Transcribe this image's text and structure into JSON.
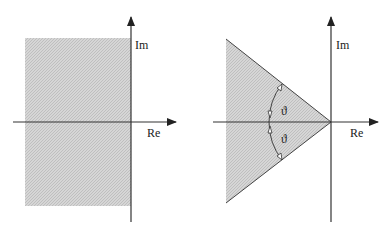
{
  "left_diagram": {
    "x_axis_label": "Re",
    "y_axis_label": "Im",
    "region": "left half-plane (Re < 0), shaded"
  },
  "right_diagram": {
    "x_axis_label": "Re",
    "y_axis_label": "Im",
    "region": "wedge sector with vertex at origin, shaded",
    "angle_label_upper": "ϑ",
    "angle_label_lower": "ϑ"
  },
  "colors": {
    "axis": "#333333",
    "shade": "#c8c8c8",
    "edge": "#444444"
  }
}
